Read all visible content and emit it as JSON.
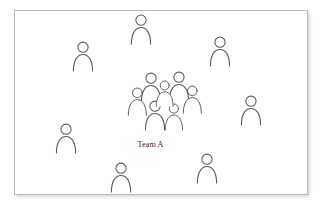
{
  "diagram": {
    "background_color": "#ffffff",
    "frame": {
      "border_color": "#b9b9b9",
      "fill_color": "#ffffff",
      "shadow": true,
      "x": 14,
      "y": 10,
      "width": 294,
      "height": 185
    },
    "label": {
      "text": "Team A",
      "color": "#2b2b2b"
    },
    "person_icon": {
      "name": "person-icon",
      "stroke_color": "#58595b",
      "fill_color": "#ffffff",
      "description": "circle head above rounded shoulders arch"
    },
    "counts": {
      "cluster_people": 7,
      "scattered_people": 7,
      "total_people": 14
    },
    "cluster": {
      "name": "Team A cluster",
      "people": [
        {
          "id": "cluster-1",
          "x": 140,
          "y": 72,
          "scale": 1.0
        },
        {
          "id": "cluster-2",
          "x": 168,
          "y": 71,
          "scale": 1.0
        },
        {
          "id": "cluster-3",
          "x": 127,
          "y": 87,
          "scale": 0.94
        },
        {
          "id": "cluster-4",
          "x": 182,
          "y": 85,
          "scale": 0.94
        },
        {
          "id": "cluster-5",
          "x": 144,
          "y": 100,
          "scale": 1.0
        },
        {
          "id": "cluster-6",
          "x": 164,
          "y": 103,
          "scale": 0.9
        },
        {
          "id": "cluster-7",
          "x": 155,
          "y": 80,
          "scale": 0.88
        }
      ]
    },
    "scattered": {
      "name": "surrounding individuals",
      "people": [
        {
          "id": "person-top-center",
          "x": 130,
          "y": 14,
          "scale": 1.0
        },
        {
          "id": "person-top-left",
          "x": 72,
          "y": 41,
          "scale": 1.0
        },
        {
          "id": "person-top-right",
          "x": 209,
          "y": 36,
          "scale": 1.0
        },
        {
          "id": "person-right",
          "x": 240,
          "y": 95,
          "scale": 1.0
        },
        {
          "id": "person-left",
          "x": 55,
          "y": 123,
          "scale": 1.0
        },
        {
          "id": "person-bottom-left",
          "x": 110,
          "y": 162,
          "scale": 1.0
        },
        {
          "id": "person-bottom-right",
          "x": 196,
          "y": 153,
          "scale": 1.0
        }
      ]
    }
  }
}
